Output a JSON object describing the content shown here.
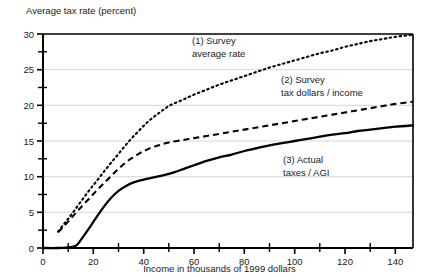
{
  "chart_data": {
    "type": "line",
    "title": "",
    "ylabel": "Average tax rate (percent)",
    "xlabel": "Income in thousands of 1999 dollars",
    "xlim": [
      0,
      147
    ],
    "ylim": [
      0,
      30
    ],
    "xticks_major": [
      0,
      20,
      40,
      60,
      80,
      100,
      120,
      140
    ],
    "xticks_minor": [
      10,
      30,
      50,
      70,
      90,
      110,
      130
    ],
    "xtick_labels": [
      "0",
      "20",
      "40",
      "60",
      "80",
      "100",
      "120",
      "140"
    ],
    "yticks_major": [
      0,
      5,
      10,
      15,
      20,
      25,
      30
    ],
    "yticks_minor": [
      2.5,
      7.5,
      12.5,
      17.5,
      22.5,
      27.5
    ],
    "ytick_labels": [
      "0",
      "5",
      "10",
      "15",
      "20",
      "25",
      "30"
    ],
    "grid": "horizontal-major",
    "legend_position": "inline-annotations",
    "series": [
      {
        "name": "(1) Survey average rate",
        "style": "dotted",
        "annotation_lines": [
          "(1) Survey",
          "average rate"
        ],
        "x": [
          6,
          10,
          14,
          18,
          22,
          26,
          30,
          34,
          38,
          42,
          46,
          50,
          55,
          60,
          65,
          70,
          75,
          80,
          85,
          90,
          95,
          100,
          105,
          110,
          115,
          120,
          125,
          130,
          135,
          140,
          147
        ],
        "y": [
          2.3,
          4.1,
          6.0,
          7.9,
          9.7,
          11.5,
          13.2,
          14.9,
          16.4,
          17.8,
          18.9,
          19.9,
          20.7,
          21.5,
          22.2,
          22.9,
          23.5,
          24.1,
          24.7,
          25.3,
          25.8,
          26.3,
          26.8,
          27.3,
          27.7,
          28.2,
          28.6,
          29.0,
          29.3,
          29.6,
          29.9
        ]
      },
      {
        "name": "(2) Survey tax dollars / income",
        "style": "dashed",
        "annotation_lines": [
          "(2) Survey",
          "tax dollars / income"
        ],
        "x": [
          6,
          10,
          14,
          18,
          22,
          26,
          30,
          34,
          38,
          42,
          46,
          50,
          55,
          60,
          65,
          70,
          75,
          80,
          85,
          90,
          95,
          100,
          105,
          110,
          115,
          120,
          125,
          130,
          135,
          140,
          147
        ],
        "y": [
          2.2,
          3.7,
          5.3,
          6.8,
          8.3,
          9.7,
          11.1,
          12.3,
          13.2,
          13.9,
          14.4,
          14.8,
          15.1,
          15.4,
          15.7,
          16.0,
          16.3,
          16.6,
          16.9,
          17.2,
          17.5,
          17.8,
          18.1,
          18.4,
          18.7,
          19.0,
          19.3,
          19.6,
          19.9,
          20.2,
          20.5
        ]
      },
      {
        "name": "(3) Actual taxes / AGI",
        "style": "solid",
        "annotation_lines": [
          "(3) Actual",
          "taxes / AGI"
        ],
        "x": [
          0,
          6,
          10,
          13,
          15,
          18,
          21,
          24,
          27,
          30,
          33,
          36,
          40,
          44,
          48,
          52,
          56,
          60,
          65,
          70,
          75,
          80,
          85,
          90,
          95,
          100,
          105,
          110,
          115,
          120,
          125,
          130,
          135,
          140,
          147
        ],
        "y": [
          0.0,
          0.0,
          0.1,
          0.3,
          1.1,
          2.6,
          4.2,
          5.7,
          7.0,
          8.0,
          8.7,
          9.2,
          9.6,
          9.9,
          10.2,
          10.6,
          11.1,
          11.6,
          12.2,
          12.7,
          13.1,
          13.6,
          14.0,
          14.4,
          14.7,
          15.0,
          15.3,
          15.6,
          15.9,
          16.1,
          16.4,
          16.6,
          16.8,
          17.0,
          17.2
        ]
      }
    ],
    "annotations": [
      {
        "id": "annot-1",
        "lines": [
          "(1) Survey",
          "average rate"
        ],
        "x": 1,
        "y": 1
      },
      {
        "id": "annot-2",
        "lines": [
          "(2) Survey",
          "tax dollars / income"
        ],
        "x": 1,
        "y": 1
      },
      {
        "id": "annot-3",
        "lines": [
          "(3) Actual",
          "taxes / AGI"
        ],
        "x": 1,
        "y": 1
      }
    ]
  },
  "axis": {
    "ylabel": "Average tax rate (percent)",
    "xlabel": "Income in thousands of 1999 dollars",
    "ytick_0": "0",
    "ytick_5": "5",
    "ytick_10": "10",
    "ytick_15": "15",
    "ytick_20": "20",
    "ytick_25": "25",
    "ytick_30": "30",
    "xtick_0": "0",
    "xtick_20": "20",
    "xtick_40": "40",
    "xtick_60": "60",
    "xtick_80": "80",
    "xtick_100": "100",
    "xtick_120": "120",
    "xtick_140": "140"
  },
  "annotations": {
    "a1_line1": "(1) Survey",
    "a1_line2": "average rate",
    "a2_line1": "(2) Survey",
    "a2_line2": "tax dollars / income",
    "a3_line1": "(3) Actual",
    "a3_line2": "taxes / AGI"
  },
  "colors": {
    "ink": "#000000",
    "grid": "#c9c9c9",
    "background": "#ffffff"
  }
}
